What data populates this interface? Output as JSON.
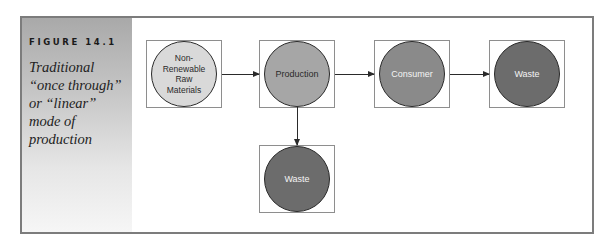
{
  "figure": {
    "label": "FIGURE 14.1",
    "caption": "Traditional “once through” or “linear” mode of production"
  },
  "diagram": {
    "nodes": [
      {
        "id": "raw-materials",
        "label": "Non-Renewable Raw Materials",
        "fill": "#d9d9d9",
        "text_color": "#2a2a2a"
      },
      {
        "id": "production",
        "label": "Production",
        "fill": "#a6a6a6",
        "text_color": "#2a2a2a"
      },
      {
        "id": "consumer",
        "label": "Consumer",
        "fill": "#8a8a8a",
        "text_color": "#f4f4f4"
      },
      {
        "id": "waste-consumer",
        "label": "Waste",
        "fill": "#6c6c6c",
        "text_color": "#f4f4f4"
      },
      {
        "id": "waste-production",
        "label": "Waste",
        "fill": "#6c6c6c",
        "text_color": "#f4f4f4"
      }
    ],
    "edges": [
      {
        "from": "raw-materials",
        "to": "production"
      },
      {
        "from": "production",
        "to": "consumer"
      },
      {
        "from": "consumer",
        "to": "waste-consumer"
      },
      {
        "from": "production",
        "to": "waste-production"
      }
    ]
  },
  "colors": {
    "frame_border": "#7c7c7c",
    "sidebar_top": "#a9a9a9",
    "sidebar_bottom": "#f6f6f6"
  }
}
